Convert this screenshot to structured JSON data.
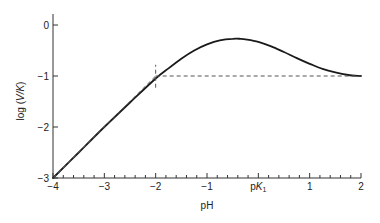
{
  "chart_data": {
    "type": "line",
    "title": "",
    "xlabel": "pH",
    "ylabel": "log (V/K)",
    "ylabel_parts": {
      "prefix": "log (",
      "italic": "V/K",
      "suffix": ")"
    },
    "xlim": [
      -4,
      2
    ],
    "ylim": [
      -3,
      0.2
    ],
    "x_ticks": [
      {
        "value": -4,
        "label": "−4"
      },
      {
        "value": -3,
        "label": "−3"
      },
      {
        "value": -2,
        "label": "−2"
      },
      {
        "value": -1,
        "label": "−1"
      },
      {
        "value": 0,
        "label": "pK1",
        "label_main": "pK",
        "label_sub": "1"
      },
      {
        "value": 1,
        "label": "1"
      },
      {
        "value": 2,
        "label": "2"
      }
    ],
    "x_minor_step": 0.2,
    "y_ticks": [
      {
        "value": 0,
        "label": "0"
      },
      {
        "value": -1,
        "label": "−1"
      },
      {
        "value": -2,
        "label": "−2"
      },
      {
        "value": -3,
        "label": "−3"
      }
    ],
    "grid": false,
    "legend": null,
    "series": [
      {
        "name": "log (V/K) vs pH",
        "style": "solid",
        "x": [
          -4.0,
          -3.5,
          -3.0,
          -2.5,
          -2.0,
          -1.75,
          -1.5,
          -1.25,
          -1.0,
          -0.75,
          -0.5,
          -0.35,
          -0.25,
          0.0,
          0.25,
          0.5,
          0.75,
          1.0,
          1.25,
          1.5,
          1.75,
          2.0
        ],
        "y": [
          -3.0,
          -2.5,
          -2.0,
          -1.52,
          -1.05,
          -0.85,
          -0.66,
          -0.5,
          -0.38,
          -0.3,
          -0.27,
          -0.27,
          -0.28,
          -0.33,
          -0.42,
          -0.53,
          -0.65,
          -0.76,
          -0.86,
          -0.93,
          -0.98,
          -1.0
        ]
      }
    ],
    "annotations": [
      {
        "type": "asymptote",
        "style": "dashed",
        "description": "Slope-1 asymptote from (−4,−3) to (−2,−1)",
        "x": [
          -4,
          -2
        ],
        "y": [
          -3,
          -1
        ]
      },
      {
        "type": "asymptote",
        "style": "dashed",
        "description": "Horizontal asymptote at log(V/K) = −1",
        "x": [
          -2,
          2
        ],
        "y": [
          -1,
          -1
        ]
      },
      {
        "type": "vline",
        "style": "dashed",
        "description": "Vertical marker at pH −2 (intersection of asymptotes)",
        "x": -2,
        "y_range": [
          -1.23,
          -0.78
        ]
      }
    ]
  }
}
